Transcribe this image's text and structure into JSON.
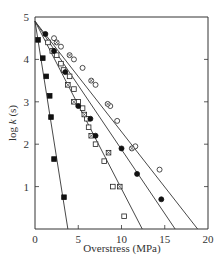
{
  "chart_data": {
    "type": "scatter",
    "title": "",
    "xlabel": "Overstress (MPa)",
    "ylabel": "log k (s)",
    "ylabel_parts": [
      "log ",
      "k",
      " (s)"
    ],
    "xlim": [
      0,
      20
    ],
    "ylim": [
      0,
      5
    ],
    "xticks": [
      0,
      5,
      10,
      15,
      20
    ],
    "yticks": [
      1,
      2,
      3,
      4,
      5
    ],
    "xtick_labels": [
      "0",
      "5",
      "10",
      "15",
      "20"
    ],
    "ytick_labels": [
      "1",
      "2",
      "3",
      "4",
      "5"
    ],
    "grid": false,
    "legend": "none",
    "series": [
      {
        "name": "filled squares",
        "marker": "square-filled",
        "points": [
          [
            0.35,
            4.46
          ],
          [
            0.9,
            4.03
          ],
          [
            1.3,
            3.6
          ],
          [
            1.7,
            3.14
          ],
          [
            1.85,
            2.64
          ],
          [
            2.2,
            1.65
          ],
          [
            3.35,
            0.75
          ]
        ],
        "fit_line": [
          [
            0,
            4.9
          ],
          [
            3.8,
            0
          ]
        ]
      },
      {
        "name": "open squares",
        "marker": "square-open",
        "points": [
          [
            1.5,
            4.4
          ],
          [
            2.0,
            4.2
          ],
          [
            2.5,
            4.1
          ],
          [
            3.0,
            3.9
          ],
          [
            3.3,
            3.75
          ],
          [
            4.0,
            3.6
          ],
          [
            4.5,
            3.3
          ],
          [
            5.0,
            3.0
          ],
          [
            5.5,
            2.85
          ],
          [
            6.0,
            2.6
          ],
          [
            6.2,
            2.4
          ],
          [
            7.0,
            2.0
          ],
          [
            8.0,
            1.6
          ],
          [
            9.0,
            1.0
          ],
          [
            10.3,
            0.3
          ]
        ],
        "fit_line": [
          [
            0,
            4.9
          ],
          [
            12.4,
            0
          ]
        ]
      },
      {
        "name": "crossed squares",
        "marker": "square-crossed",
        "points": [
          [
            3.8,
            3.4
          ],
          [
            4.5,
            3.0
          ],
          [
            5.7,
            2.7
          ],
          [
            6.5,
            2.2
          ],
          [
            8.5,
            1.8
          ],
          [
            9.8,
            1.0
          ]
        ],
        "fit_line": null
      },
      {
        "name": "filled circles",
        "marker": "circle-filled",
        "points": [
          [
            1.2,
            4.6
          ],
          [
            2.2,
            4.2
          ],
          [
            3.5,
            3.7
          ],
          [
            5.0,
            2.9
          ],
          [
            6.4,
            2.6
          ],
          [
            7.0,
            2.2
          ],
          [
            10.0,
            1.9
          ],
          [
            11.8,
            1.3
          ],
          [
            14.6,
            0.7
          ]
        ],
        "fit_line": [
          [
            0,
            4.9
          ],
          [
            16.2,
            0
          ]
        ]
      },
      {
        "name": "open circles",
        "marker": "circle-open",
        "points": [
          [
            2.2,
            4.5
          ],
          [
            3.0,
            4.3
          ],
          [
            4.5,
            4.0
          ],
          [
            5.5,
            3.8
          ],
          [
            7.0,
            3.4
          ],
          [
            8.7,
            2.9
          ],
          [
            9.5,
            2.55
          ],
          [
            11.6,
            1.95
          ],
          [
            14.4,
            1.4
          ]
        ],
        "fit_line": [
          [
            0,
            4.9
          ],
          [
            18.8,
            0
          ]
        ]
      },
      {
        "name": "crossed circles",
        "marker": "circle-crossed",
        "points": [
          [
            2.5,
            4.4
          ],
          [
            4.0,
            4.1
          ],
          [
            6.5,
            3.5
          ],
          [
            8.4,
            2.95
          ],
          [
            11.2,
            1.9
          ]
        ],
        "fit_line": null
      }
    ]
  }
}
